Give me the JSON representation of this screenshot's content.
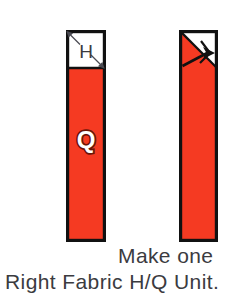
{
  "figure": {
    "title_hidden": "",
    "background_color": "#ffffff",
    "fabric_color": "#f53a22",
    "outline_color": "#111111",
    "text_color": "#3b3b3f"
  },
  "units": [
    {
      "id": "left-unit",
      "name": "half-square-triangle-over-quarter-strip",
      "patch_label": "H",
      "strip_label": "Q",
      "marking": "diagonal-cut-line-with-arrows",
      "patch_fill": "#ffffff",
      "strip_fill": "#f53a22"
    },
    {
      "id": "right-unit",
      "name": "pressed-right-fabric-unit",
      "patch_label": "",
      "strip_label": "",
      "marking": "press-direction-arrow",
      "patch_fill": "#ffffff",
      "strip_fill": "#f53a22"
    }
  ],
  "captions": {
    "make_one": "Make one",
    "unit_name": "Right Fabric H/Q Unit."
  }
}
